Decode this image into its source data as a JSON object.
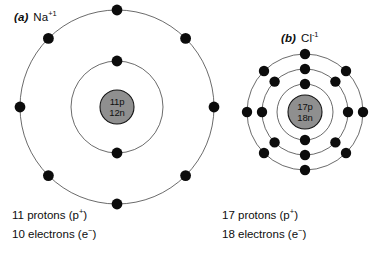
{
  "figure": {
    "width": 383,
    "height": 255,
    "background": "#ffffff"
  },
  "colors": {
    "nucleus_fill": "#8f8f8f",
    "nucleus_stroke": "#141414",
    "electron": "#0c0c0c",
    "shell_line": "#2b2b2b",
    "text": "#0d0d0d"
  },
  "atoms": [
    {
      "id": "sodium",
      "tag": "(a)",
      "species": "Na",
      "charge": "+1",
      "label_plain": "(a) Na+1",
      "nucleus": {
        "protons_line": "11p",
        "neutrons_line": "12n",
        "radius": 17
      },
      "center": {
        "x": 117,
        "y": 107
      },
      "shells": [
        {
          "index": 1,
          "radius": 46,
          "electron_count": 2,
          "angles": [
            270,
            90
          ]
        },
        {
          "index": 2,
          "radius": 97,
          "electron_count": 8,
          "angles": [
            270,
            315,
            0,
            45,
            90,
            135,
            180,
            225
          ]
        }
      ],
      "caption": {
        "line1": "11 protons (p+)",
        "line2": "10 electrons (e-)",
        "protons": 11,
        "electrons": 10,
        "neutrons": 12
      }
    },
    {
      "id": "chloride",
      "tag": "(b)",
      "species": "Cl",
      "charge": "-1",
      "label_plain": "(b) Cl-1",
      "nucleus": {
        "protons_line": "17p",
        "neutrons_line": "18n",
        "radius": 17
      },
      "center": {
        "x": 305,
        "y": 112
      },
      "shells": [
        {
          "index": 1,
          "radius": 28,
          "electron_count": 2,
          "angles": [
            270,
            90
          ]
        },
        {
          "index": 2,
          "radius": 43,
          "electron_count": 8,
          "angles": [
            270,
            315,
            0,
            45,
            90,
            135,
            180,
            225
          ]
        },
        {
          "index": 3,
          "radius": 58,
          "electron_count": 8,
          "angles": [
            270,
            315,
            0,
            45,
            90,
            135,
            180,
            225
          ]
        }
      ],
      "caption": {
        "line1": "17 protons (p+)",
        "line2": "18 electrons (e-)",
        "protons": 17,
        "electrons": 18,
        "neutrons": 18
      }
    }
  ]
}
